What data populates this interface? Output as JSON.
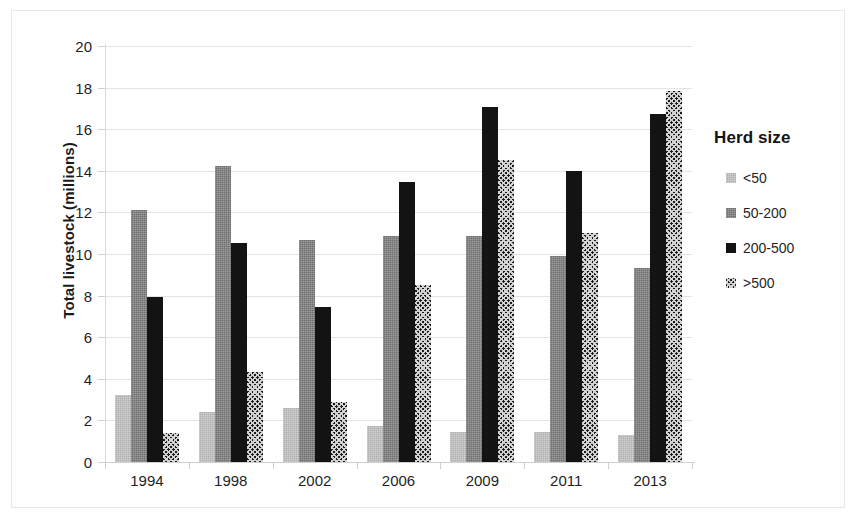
{
  "chart_data": {
    "type": "bar",
    "title": "",
    "xlabel": "",
    "ylabel": "Total livestock (millions)",
    "ylim": [
      0,
      20
    ],
    "ytick_step": 2,
    "yticks": [
      20,
      18,
      16,
      14,
      12,
      10,
      8,
      6,
      4,
      2,
      0
    ],
    "grid": true,
    "legend_title": "Herd size",
    "legend_position": "right",
    "categories": [
      "1994",
      "1998",
      "2002",
      "2006",
      "2009",
      "2011",
      "2013"
    ],
    "series": [
      {
        "name": "<50",
        "swatch": "light-grey",
        "color": "#b0b0b0",
        "values": [
          3.2,
          2.4,
          2.6,
          1.75,
          1.45,
          1.45,
          1.3
        ]
      },
      {
        "name": "50-200",
        "swatch": "medium-grey",
        "color": "#707070",
        "values": [
          12.1,
          14.25,
          10.65,
          10.85,
          10.85,
          9.9,
          9.35
        ]
      },
      {
        "name": "200-500",
        "swatch": "black",
        "color": "#131313",
        "values": [
          7.95,
          10.55,
          7.45,
          13.45,
          17.05,
          14.0,
          16.75
        ]
      },
      {
        "name": ">500",
        "swatch": "checkerboard",
        "color": "#1c1c1c",
        "values": [
          1.4,
          4.35,
          2.9,
          8.5,
          14.5,
          11.0,
          17.85
        ]
      }
    ]
  }
}
